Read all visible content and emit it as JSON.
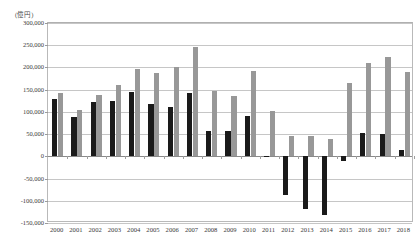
{
  "chart_data": {
    "type": "bar",
    "title": "",
    "unit_label": "(億円)",
    "xlabel": "",
    "ylabel": "",
    "ylim": [
      -150000,
      300000
    ],
    "ytick_step": 50000,
    "ytick_labels": [
      "300,000",
      "250,000",
      "200,000",
      "150,000",
      "100,000",
      "50,000",
      "0",
      "-50,000",
      "-100,000",
      "-150,000"
    ],
    "ytick_values": [
      300000,
      250000,
      200000,
      150000,
      100000,
      50000,
      0,
      -50000,
      -100000,
      -150000
    ],
    "grid": true,
    "legend": "none",
    "categories": [
      "2000",
      "2001",
      "2002",
      "2003",
      "2004",
      "2005",
      "2006",
      "2007",
      "2008",
      "2009",
      "2010",
      "2011",
      "2012",
      "2013",
      "2014",
      "2015",
      "2016",
      "2017",
      "2018"
    ],
    "series": [
      {
        "name": "series-black",
        "color": "#1a1a1a",
        "values": [
          128000,
          88000,
          122000,
          125000,
          144000,
          117000,
          110000,
          143000,
          58000,
          57000,
          91000,
          -2000,
          -88000,
          -118000,
          -133000,
          -11000,
          52000,
          50000,
          14000
        ]
      },
      {
        "name": "series-gray",
        "color": "#989898",
        "values": [
          142000,
          104000,
          137000,
          161000,
          197000,
          187000,
          202000,
          247000,
          148000,
          136000,
          193000,
          101000,
          45000,
          46000,
          39000,
          164000,
          211000,
          224000,
          190000
        ]
      }
    ]
  }
}
